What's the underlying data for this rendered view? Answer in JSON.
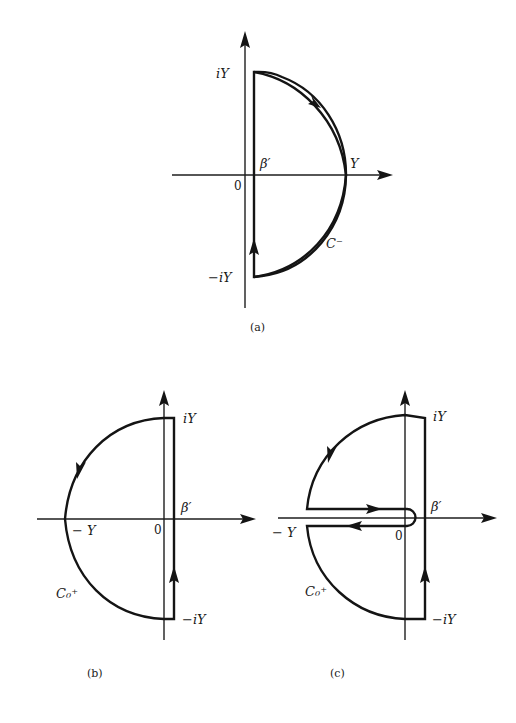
{
  "figures": [
    {
      "id": "a",
      "caption": "(a)",
      "labels": {
        "top": "iY",
        "bottom": "−iY",
        "origin": "0",
        "beta": "β′",
        "right": "Y",
        "contour": "C⁻"
      }
    },
    {
      "id": "b",
      "caption": "(b)",
      "labels": {
        "top": "iY",
        "bottom": "−iY",
        "origin": "0",
        "beta": "β′",
        "left": "− Y",
        "contour": "C₀⁺"
      }
    },
    {
      "id": "c",
      "caption": "(c)",
      "labels": {
        "top": "iY",
        "bottom": "−iY",
        "origin": "0",
        "beta": "β′",
        "left": "− Y",
        "contour": "C₀⁺"
      }
    }
  ],
  "colors": {
    "ink": "#141414",
    "background": "#ffffff"
  }
}
